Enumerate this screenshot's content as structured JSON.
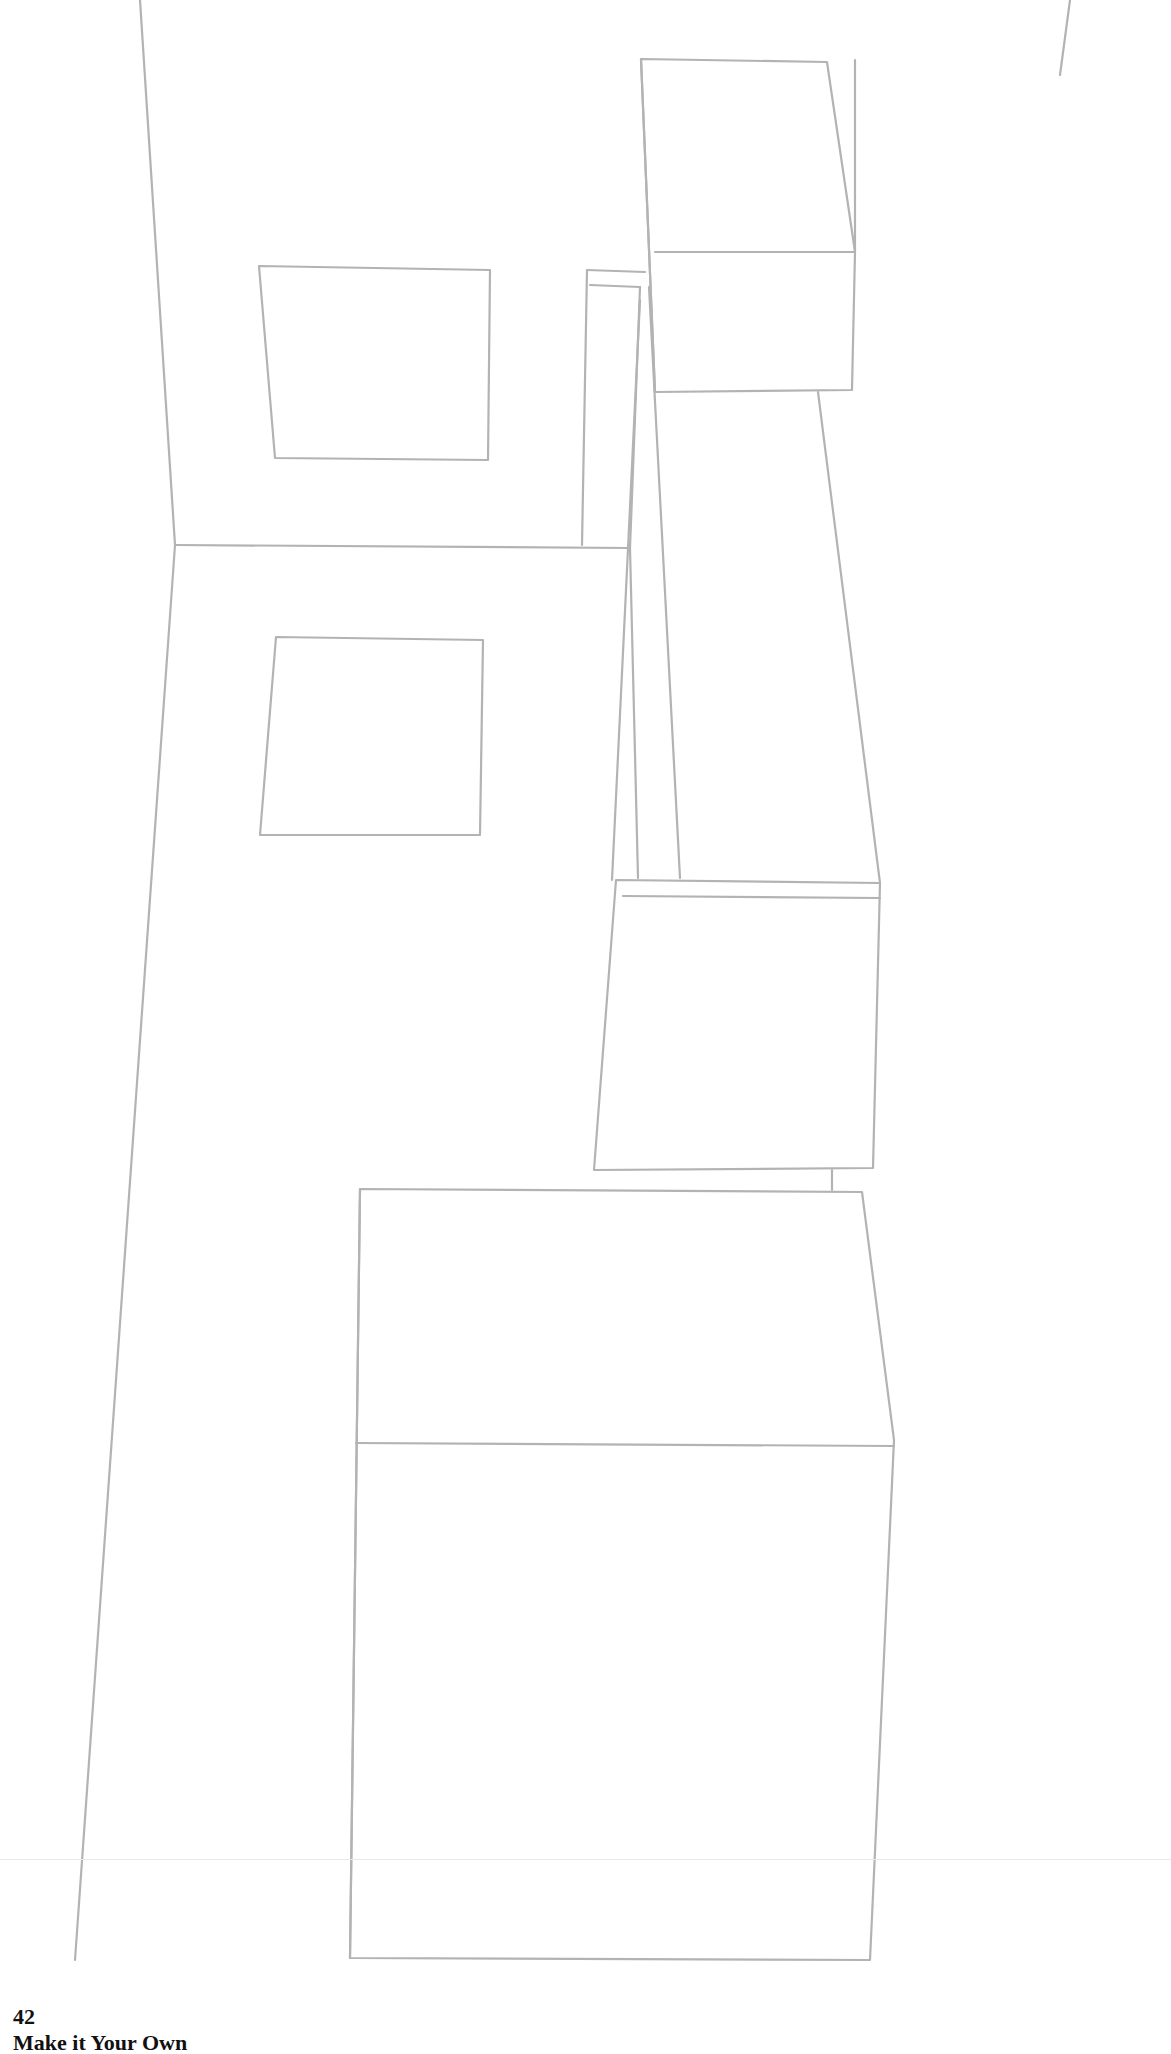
{
  "page": {
    "number": "42",
    "title": "Make it Your Own"
  },
  "drawing": {
    "stroke": "#b3b3b3",
    "stroke_width": 2.2,
    "lines": [
      [
        140,
        0,
        175,
        545
      ],
      [
        175,
        545,
        75,
        1960
      ],
      [
        1070,
        0,
        1060,
        75
      ],
      [
        175,
        545,
        630,
        548
      ],
      [
        582,
        545,
        587,
        270
      ],
      [
        587,
        270,
        645,
        272
      ],
      [
        590,
        285,
        640,
        287
      ],
      [
        630,
        548,
        638,
        878
      ],
      [
        640,
        287,
        630,
        548
      ],
      [
        649,
        287,
        680,
        878
      ],
      [
        640,
        300,
        612,
        880
      ]
    ],
    "polygons": [
      {
        "name": "upper-wall-window",
        "points": "259,266 490,270 488,460 275,458"
      },
      {
        "name": "floor-rug",
        "points": "276,637 483,640 480,835 260,835"
      },
      {
        "name": "upper-right-cabinet-front",
        "points": "641,59 827,62 855,252 852,390 655,392"
      },
      {
        "name": "upper-right-cabinet-mid",
        "points": "655,252 855,252"
      },
      {
        "name": "lower-right-cabinet",
        "points": "616,880 880,883 873,1168 594,1170"
      },
      {
        "name": "lower-right-cabinet-inner",
        "points": "623,896 880,898"
      },
      {
        "name": "bottom-box",
        "points": "360,1189 862,1192 894,1440 870,1960 350,1958"
      },
      {
        "name": "bottom-box-mid",
        "points": "356,1443 894,1446"
      }
    ],
    "extra_lines": [
      [
        818,
        392,
        880,
        883
      ],
      [
        855,
        252,
        855,
        60
      ],
      [
        832,
        1170,
        832,
        1190
      ],
      [
        641,
        59,
        655,
        392
      ],
      [
        360,
        1189,
        350,
        1958
      ]
    ]
  }
}
